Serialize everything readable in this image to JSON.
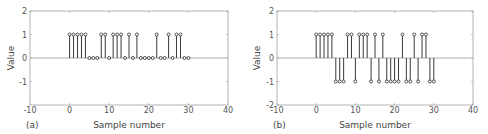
{
  "chart_data": [
    {
      "type": "stem",
      "panel_label": "(a)",
      "title": "",
      "xlabel": "Sample number",
      "ylabel": "Value",
      "xlim": [
        -10,
        40
      ],
      "ylim": [
        -2,
        2
      ],
      "xticks": [
        -10,
        0,
        10,
        20,
        30,
        40
      ],
      "xtick_labels": [
        "-10",
        "0",
        "10",
        "20",
        "30",
        "40"
      ],
      "yticks": [
        2,
        1,
        0,
        -1
      ],
      "ytick_labels": [
        "2",
        "1",
        "0",
        "-1"
      ],
      "grid": false,
      "x": [
        0,
        1,
        2,
        3,
        4,
        5,
        6,
        7,
        8,
        9,
        10,
        11,
        12,
        13,
        14,
        15,
        16,
        17,
        18,
        19,
        20,
        21,
        22,
        23,
        24,
        25,
        26,
        27,
        28,
        29,
        30
      ],
      "values": [
        1,
        1,
        1,
        1,
        1,
        0,
        0,
        0,
        1,
        1,
        0,
        1,
        1,
        1,
        0,
        1,
        0,
        1,
        0,
        0,
        0,
        0,
        1,
        0,
        0,
        1,
        0,
        1,
        1,
        0,
        0
      ]
    },
    {
      "type": "stem",
      "panel_label": "(b)",
      "title": "",
      "xlabel": "Sample number",
      "ylabel": "Value",
      "xlim": [
        -10,
        40
      ],
      "ylim": [
        -2,
        2
      ],
      "xticks": [
        -10,
        0,
        10,
        20,
        30,
        40
      ],
      "xtick_labels": [
        "-10",
        "0",
        "10",
        "20",
        "30",
        "40"
      ],
      "yticks": [
        2,
        1,
        0,
        -1,
        -2
      ],
      "ytick_labels": [
        "2",
        "1",
        "0",
        "-1",
        "-2"
      ],
      "grid": false,
      "x": [
        0,
        1,
        2,
        3,
        4,
        5,
        6,
        7,
        8,
        9,
        10,
        11,
        12,
        13,
        14,
        15,
        16,
        17,
        18,
        19,
        20,
        21,
        22,
        23,
        24,
        25,
        26,
        27,
        28,
        29,
        30
      ],
      "values": [
        1,
        1,
        1,
        1,
        1,
        -1,
        -1,
        -1,
        1,
        1,
        -1,
        1,
        1,
        1,
        -1,
        1,
        -1,
        1,
        -1,
        -1,
        -1,
        -1,
        1,
        -1,
        -1,
        1,
        -1,
        1,
        1,
        -1,
        -1
      ]
    }
  ],
  "colors": {
    "stem": "#3a3a3a",
    "marker_stroke": "#2a2a2a",
    "zero_line": "#9a9a9a",
    "axis_box": "#a0a0a0",
    "text": "#555555"
  }
}
